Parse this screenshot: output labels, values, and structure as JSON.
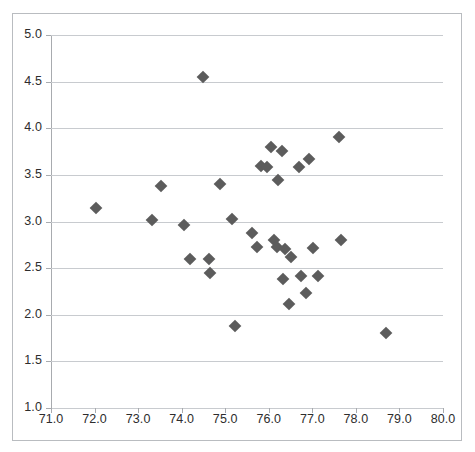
{
  "chart_data": {
    "type": "scatter",
    "title": "",
    "xlabel": "",
    "ylabel": "",
    "xlim": [
      71.0,
      80.0
    ],
    "ylim": [
      1.0,
      5.0
    ],
    "xticks": [
      "71.0",
      "72.0",
      "73.0",
      "74.0",
      "75.0",
      "76.0",
      "77.0",
      "78.0",
      "79.0",
      "80.0"
    ],
    "xtick_values": [
      71.0,
      72.0,
      73.0,
      74.0,
      75.0,
      76.0,
      77.0,
      78.0,
      79.0,
      80.0
    ],
    "yticks": [
      "1.0",
      "1.5",
      "2.0",
      "2.5",
      "3.0",
      "3.5",
      "4.0",
      "4.5",
      "5.0"
    ],
    "ytick_values": [
      1.0,
      1.5,
      2.0,
      2.5,
      3.0,
      3.5,
      4.0,
      4.5,
      5.0
    ],
    "grid": "horizontal",
    "legend": "none",
    "marker": "diamond",
    "marker_color": "#5c5c5c",
    "marker_size": 9,
    "series": [
      {
        "name": "series-1",
        "points": [
          [
            72.03,
            3.14
          ],
          [
            73.32,
            3.02
          ],
          [
            73.52,
            3.38
          ],
          [
            74.06,
            2.96
          ],
          [
            74.2,
            2.6
          ],
          [
            74.5,
            4.55
          ],
          [
            74.62,
            2.6
          ],
          [
            74.66,
            2.45
          ],
          [
            74.88,
            3.4
          ],
          [
            75.16,
            3.03
          ],
          [
            75.22,
            1.88
          ],
          [
            75.62,
            2.88
          ],
          [
            75.73,
            2.73
          ],
          [
            75.83,
            3.6
          ],
          [
            75.95,
            3.58
          ],
          [
            76.05,
            3.8
          ],
          [
            76.12,
            2.8
          ],
          [
            76.18,
            2.73
          ],
          [
            76.22,
            3.44
          ],
          [
            76.3,
            3.76
          ],
          [
            76.32,
            2.38
          ],
          [
            76.38,
            2.7
          ],
          [
            76.46,
            2.12
          ],
          [
            76.52,
            2.62
          ],
          [
            76.7,
            3.58
          ],
          [
            76.75,
            2.42
          ],
          [
            76.86,
            2.23
          ],
          [
            76.92,
            3.67
          ],
          [
            77.02,
            2.72
          ],
          [
            77.14,
            2.42
          ],
          [
            77.62,
            3.91
          ],
          [
            77.66,
            2.8
          ],
          [
            78.68,
            1.8
          ]
        ]
      }
    ]
  }
}
